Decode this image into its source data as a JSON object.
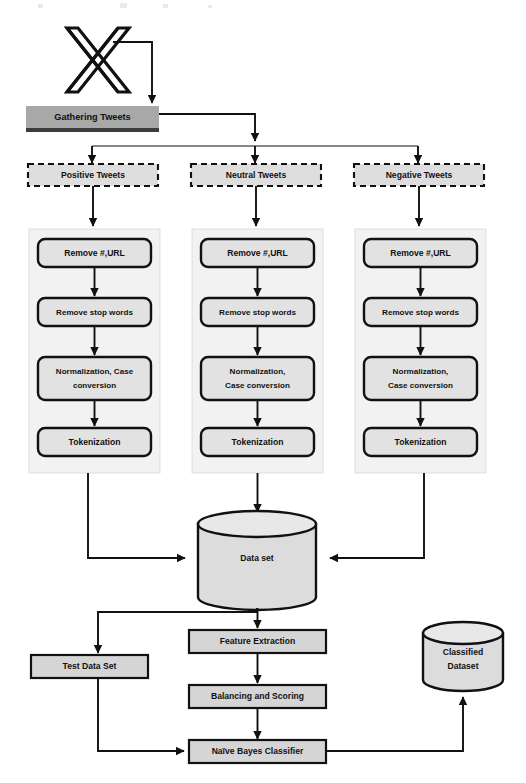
{
  "diagram": {
    "source_logo": "x-twitter-logo",
    "colors": {
      "gathering_fill": "#a8a8a8",
      "dashed_fill": "#dedede",
      "process_fill": "#e2e2e2",
      "rect_fill": "#d5d5d5",
      "cylinder_fill": "#dcdcdc",
      "panel_fill": "#f2f2f2",
      "stroke": "#111111"
    },
    "source": {
      "label": "Gathering Tweets"
    },
    "branches": [
      {
        "id": "positive",
        "label": "Positive Tweets"
      },
      {
        "id": "neutral",
        "label": "Neutral Tweets"
      },
      {
        "id": "negative",
        "label": "Negative Tweets"
      }
    ],
    "pipelines": [
      {
        "branch": "positive",
        "steps": [
          {
            "label": "Remove #,URL",
            "lines": [
              "Remove #,URL"
            ]
          },
          {
            "label": "Remove stop words",
            "lines": [
              "Remove stop words"
            ]
          },
          {
            "label": "Normalization, Case conversion",
            "lines": [
              "Normalization, Case",
              "conversion"
            ]
          },
          {
            "label": "Tokenization",
            "lines": [
              "Tokenization"
            ]
          }
        ]
      },
      {
        "branch": "neutral",
        "steps": [
          {
            "label": "Remove #,URL",
            "lines": [
              "Remove #,URL"
            ]
          },
          {
            "label": "Remove stop words",
            "lines": [
              "Remove stop words"
            ]
          },
          {
            "label": "Normalization, Case conversion",
            "lines": [
              "Normalization,",
              "Case conversion"
            ]
          },
          {
            "label": "Tokenization",
            "lines": [
              "Tokenization"
            ]
          }
        ]
      },
      {
        "branch": "negative",
        "steps": [
          {
            "label": "Remove #,URL",
            "lines": [
              "Remove #,URL"
            ]
          },
          {
            "label": "Remove stop words",
            "lines": [
              "Remove stop words"
            ]
          },
          {
            "label": "Normalization, Case conversion",
            "lines": [
              "Normalization,",
              "Case conversion"
            ]
          },
          {
            "label": "Tokenization",
            "lines": [
              "Tokenization"
            ]
          }
        ]
      }
    ],
    "datastores": [
      {
        "id": "data-set",
        "label": "Data set",
        "lines": [
          "Data set"
        ]
      },
      {
        "id": "classified-dataset",
        "label": "Classified Dataset",
        "lines": [
          "Classified",
          "Dataset"
        ]
      }
    ],
    "analysis": [
      {
        "id": "feature-extraction",
        "label": "Feature Extraction"
      },
      {
        "id": "balancing-and-scoring",
        "label": "Balancing and Scoring"
      },
      {
        "id": "naive-bayes-classifier",
        "label": "Naïve Bayes Classifier"
      },
      {
        "id": "test-data-set",
        "label": "Test Data Set"
      }
    ]
  }
}
